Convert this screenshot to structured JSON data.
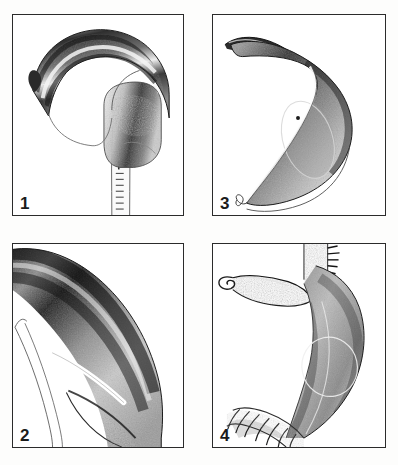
{
  "plate": {
    "title": "Comparative figure plate of four stippled anatomical drawings",
    "background_color": "#ffffff",
    "frame_color": "#2b2b2b",
    "ink_color": "#1a1a1a",
    "stipple_color": "#3a3a3a",
    "columns": 2,
    "rows": 2
  },
  "panels": [
    {
      "id": "panel-1",
      "number": "1",
      "position": "top-left",
      "caption": "",
      "subject": "slender hooked structure with recurved tip on a narrow ladder-marked shaft",
      "features": [
        "recurved hook tip",
        "longitudinal ridge bands",
        "swollen base",
        "segmented shaft with transverse rungs"
      ]
    },
    {
      "id": "panel-3",
      "number": "3",
      "position": "top-right",
      "caption": "",
      "subject": "broad sickle-shaped body with tapered drawn-out apex",
      "features": [
        "elongated apex",
        "dark dorsal shading",
        "oval internal outline",
        "fine basal filament"
      ]
    },
    {
      "id": "panel-2",
      "number": "2",
      "position": "bottom-left",
      "caption": "",
      "subject": "enlarged detail of a curved banded structure showing a pale highlight groove",
      "features": [
        "broad curved band",
        "white highlight streak",
        "oblique suture line",
        "double outline margin"
      ]
    },
    {
      "id": "panel-4",
      "number": "4",
      "position": "bottom-right",
      "caption": "",
      "subject": "curved swollen organ bearing a slender lateral hook and ringed basal stalk",
      "features": [
        "lateral hook process",
        "ringed basal stalk",
        "oval internal outline",
        "bristled upper margin"
      ]
    }
  ]
}
